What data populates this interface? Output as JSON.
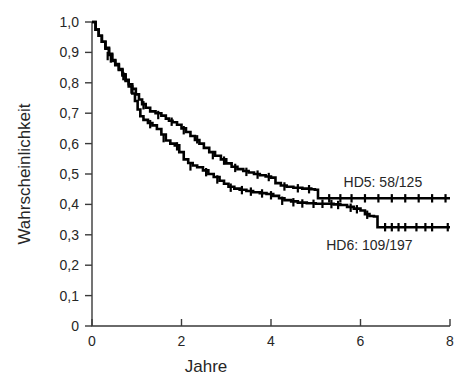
{
  "chart_data": {
    "type": "line",
    "title": "",
    "subtitle": "",
    "xlabel": "Jahre",
    "ylabel": "Wahrscheinlichkeit",
    "xlim": [
      0,
      8
    ],
    "ylim": [
      0,
      1
    ],
    "grid": false,
    "legend_position": "inline-right",
    "xticks": [
      0,
      2,
      4,
      6,
      8
    ],
    "xtick_labels": [
      "0",
      "2",
      "4",
      "6",
      "8"
    ],
    "yticks": [
      0,
      0.1,
      0.2,
      0.3,
      0.4,
      0.5,
      0.6,
      0.7,
      0.8,
      0.9,
      1.0
    ],
    "ytick_labels": [
      "0",
      "0,1",
      "0,2",
      "0,3",
      "0,4",
      "0,5",
      "0,6",
      "0,7",
      "0,8",
      "0,9",
      "1,0"
    ],
    "annotations": [
      {
        "text": "HD5: 58/125",
        "x": 6.5,
        "y": 0.475
      },
      {
        "text": "HD6: 109/197",
        "x": 6.2,
        "y": 0.265
      }
    ],
    "series": [
      {
        "name": "HD5: 58/125",
        "label": "HD5",
        "events": "58",
        "total": "125",
        "color": "#000000",
        "final_value": 0.42,
        "x": [
          0.0,
          0.08,
          0.15,
          0.22,
          0.3,
          0.38,
          0.45,
          0.52,
          0.6,
          0.68,
          0.75,
          0.82,
          0.9,
          0.98,
          1.05,
          1.12,
          1.2,
          1.3,
          1.42,
          1.55,
          1.65,
          1.72,
          1.8,
          1.9,
          2.0,
          2.1,
          2.2,
          2.3,
          2.4,
          2.5,
          2.62,
          2.75,
          2.88,
          3.0,
          3.12,
          3.25,
          3.38,
          3.5,
          3.62,
          3.75,
          3.88,
          4.0,
          4.1,
          4.22,
          4.35,
          4.5,
          4.7,
          4.9,
          4.98,
          5.05,
          5.2,
          5.45,
          5.6,
          6.0,
          6.5,
          7.0,
          7.5,
          8.0
        ],
        "y": [
          1.0,
          0.975,
          0.955,
          0.935,
          0.915,
          0.895,
          0.875,
          0.862,
          0.845,
          0.828,
          0.81,
          0.795,
          0.78,
          0.762,
          0.745,
          0.73,
          0.718,
          0.706,
          0.7,
          0.692,
          0.682,
          0.675,
          0.67,
          0.662,
          0.65,
          0.638,
          0.625,
          0.612,
          0.6,
          0.586,
          0.572,
          0.56,
          0.548,
          0.535,
          0.524,
          0.516,
          0.51,
          0.505,
          0.5,
          0.496,
          0.492,
          0.488,
          0.47,
          0.462,
          0.458,
          0.455,
          0.452,
          0.45,
          0.448,
          0.42,
          0.42,
          0.42,
          0.42,
          0.42,
          0.42,
          0.42,
          0.42,
          0.42
        ],
        "censor_x": [
          0.35,
          0.7,
          1.15,
          1.48,
          1.78,
          2.05,
          2.35,
          2.7,
          2.95,
          3.2,
          3.45,
          3.7,
          3.95,
          4.3,
          4.6,
          4.85,
          5.3,
          5.55,
          5.8,
          6.1,
          6.4,
          6.7,
          7.0,
          7.3,
          7.6,
          7.9
        ],
        "censor_y": [
          0.888,
          0.822,
          0.726,
          0.694,
          0.672,
          0.644,
          0.614,
          0.562,
          0.544,
          0.52,
          0.507,
          0.498,
          0.49,
          0.459,
          0.453,
          0.45,
          0.42,
          0.42,
          0.42,
          0.42,
          0.42,
          0.42,
          0.42,
          0.42,
          0.42,
          0.42
        ]
      },
      {
        "name": "HD6: 109/197",
        "label": "HD6",
        "events": "109",
        "total": "197",
        "color": "#000000",
        "final_value": 0.325,
        "x": [
          0.0,
          0.08,
          0.15,
          0.22,
          0.3,
          0.38,
          0.45,
          0.52,
          0.6,
          0.68,
          0.75,
          0.82,
          0.9,
          0.96,
          1.02,
          1.08,
          1.15,
          1.25,
          1.35,
          1.45,
          1.55,
          1.65,
          1.75,
          1.85,
          1.95,
          2.05,
          2.15,
          2.25,
          2.35,
          2.48,
          2.6,
          2.72,
          2.85,
          2.95,
          3.05,
          3.18,
          3.3,
          3.45,
          3.6,
          3.75,
          3.9,
          4.05,
          4.18,
          4.3,
          4.45,
          4.6,
          4.8,
          5.0,
          5.2,
          5.4,
          5.55,
          5.7,
          5.85,
          6.0,
          6.1,
          6.2,
          6.3,
          6.38,
          6.5,
          6.8,
          7.1,
          7.4,
          7.7,
          8.0
        ],
        "y": [
          1.0,
          0.975,
          0.955,
          0.935,
          0.912,
          0.892,
          0.872,
          0.858,
          0.842,
          0.824,
          0.806,
          0.788,
          0.765,
          0.74,
          0.712,
          0.69,
          0.678,
          0.668,
          0.66,
          0.648,
          0.63,
          0.61,
          0.6,
          0.594,
          0.572,
          0.548,
          0.536,
          0.528,
          0.522,
          0.512,
          0.5,
          0.49,
          0.478,
          0.468,
          0.458,
          0.452,
          0.448,
          0.444,
          0.44,
          0.437,
          0.434,
          0.428,
          0.42,
          0.414,
          0.41,
          0.406,
          0.404,
          0.402,
          0.402,
          0.4,
          0.398,
          0.392,
          0.386,
          0.38,
          0.368,
          0.362,
          0.36,
          0.325,
          0.325,
          0.325,
          0.325,
          0.325,
          0.325,
          0.325
        ],
        "censor_x": [
          0.42,
          0.88,
          1.3,
          1.6,
          1.9,
          2.2,
          2.55,
          2.8,
          3.1,
          3.35,
          3.55,
          3.8,
          4.0,
          4.25,
          4.5,
          4.7,
          4.95,
          5.15,
          5.35,
          5.5,
          5.78,
          5.92,
          6.15,
          6.55,
          6.7,
          6.85,
          7.0,
          7.25,
          7.45,
          7.6,
          7.95
        ],
        "censor_y": [
          0.88,
          0.778,
          0.664,
          0.618,
          0.591,
          0.525,
          0.506,
          0.482,
          0.455,
          0.447,
          0.442,
          0.436,
          0.43,
          0.412,
          0.407,
          0.403,
          0.402,
          0.402,
          0.401,
          0.398,
          0.389,
          0.384,
          0.366,
          0.325,
          0.325,
          0.325,
          0.325,
          0.325,
          0.325,
          0.325,
          0.325
        ]
      }
    ]
  }
}
